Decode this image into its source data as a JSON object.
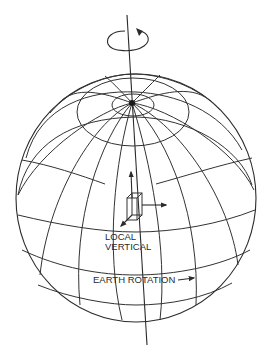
{
  "figure": {
    "type": "diagram",
    "colors": {
      "line": "#2b2b2b",
      "background": "#ffffff",
      "text": "#2a2a2a"
    }
  },
  "labels": {
    "local_vertical_line1": "LOCAL",
    "local_vertical_line2": "VERTICAL",
    "earth_rotation": "EARTH ROTATION"
  },
  "icons": {
    "rotation": "circular-arrow-icon",
    "axis": "rotation-axis-line",
    "frame": "cube-frame-icon"
  }
}
